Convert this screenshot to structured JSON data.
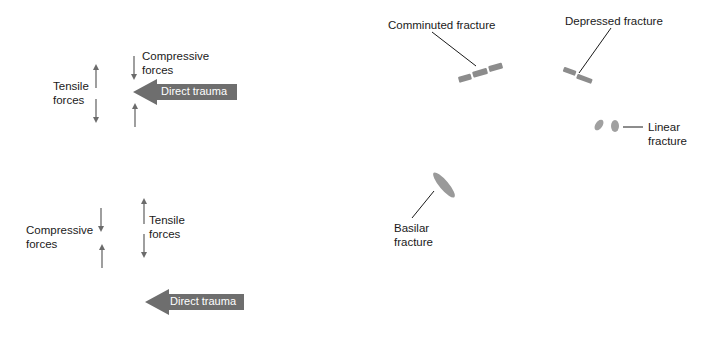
{
  "panel_a": {
    "tensile_label": "Tensile\nforces",
    "compressive_label": "Compressive\nforces",
    "trauma_label": "Direct trauma"
  },
  "panel_b": {
    "compressive_label": "Compressive\nforces",
    "tensile_label": "Tensile\nforces",
    "trauma_label": "Direct trauma"
  },
  "fractures": {
    "comminuted": "Comminuted fracture",
    "depressed": "Depressed fracture",
    "linear": "Linear\nfracture",
    "basilar": "Basilar\nfracture"
  },
  "colors": {
    "arrow": "#6b6b6b",
    "trauma_fill": "#6e6e6e",
    "fracture_fill": "#8c8c8c",
    "leader_line": "#1a1a1a"
  }
}
